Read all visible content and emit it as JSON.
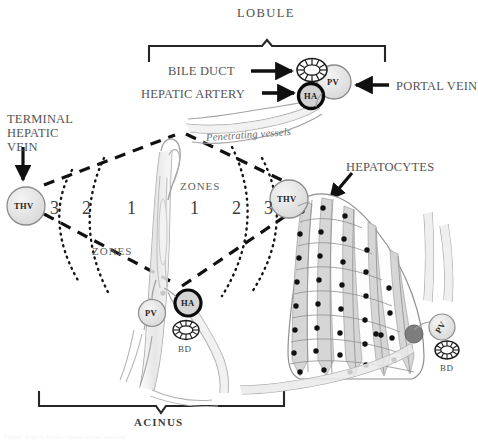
{
  "figure": {
    "width": 478,
    "height": 443,
    "background": "#ffffff"
  },
  "brackets": {
    "top": {
      "label": "LOBULE",
      "x_start": 148,
      "x_end": 386,
      "y": 40
    },
    "bottom": {
      "label": "ACINUS",
      "x_start": 38,
      "x_end": 285,
      "y": 392
    }
  },
  "labels": {
    "bile_duct": "BILE DUCT",
    "hepatic_artery": "HEPATIC ARTERY",
    "portal_vein": "PORTAL VEIN",
    "terminal_hepatic_vein": "TERMINAL\nHEPATIC\nVEIN",
    "hepatocytes": "HEPATOCYTES",
    "penetrating_vessels": "Penetrating vessels",
    "zones_left": "ZONES",
    "zones_right": "ZONES"
  },
  "zone_numbers": {
    "left": [
      "3",
      "2",
      "1"
    ],
    "right": [
      "1",
      "2",
      "3"
    ]
  },
  "nodes": {
    "thv_left": "THV",
    "thv_right": "THV",
    "pv_top": "PV",
    "pv_bottom": "PV",
    "pv_right": "PV",
    "ha_top": "HA",
    "ha_bottom": "HA",
    "bd_bottom": "BD",
    "bd_right": "BD"
  },
  "colors": {
    "ink": "#1d1d1d",
    "label_gray": "#555555",
    "vessel_fill": "#e9e9e9",
    "vessel_stroke": "#9a9a9a",
    "node_fill": "#e4e4e4",
    "nucleus": "#111111",
    "bracket": "#262626"
  },
  "caption": "Figure: hepatic lobule versus acinus zonation"
}
